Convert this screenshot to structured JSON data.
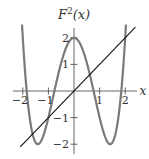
{
  "chart_data": {
    "type": "line",
    "title_display": {
      "base": "F",
      "sup": "2",
      "rest": "(x)"
    },
    "xlabel": "x",
    "ylabel": "",
    "xlim": [
      -2.1,
      2.4
    ],
    "ylim": [
      -2.2,
      2.6
    ],
    "xticks": [
      -2,
      -1,
      1,
      2
    ],
    "xtick_labels": [
      "−2",
      "−1",
      "1",
      "2"
    ],
    "yticks": [
      2,
      1,
      -1,
      -2
    ],
    "ytick_labels": [
      "2",
      "1",
      "−1",
      "−2"
    ],
    "grid": false,
    "legend": null,
    "series": [
      {
        "name": "F^2(x) = x^4 - 4x^2 + 2",
        "color": "#7a7a7a",
        "x": [
          -2.03,
          -2.0,
          -1.8,
          -1.6,
          -1.414,
          -1.2,
          -1.0,
          -0.8,
          -0.6,
          -0.4,
          -0.2,
          0.0,
          0.2,
          0.4,
          0.6,
          0.8,
          1.0,
          1.2,
          1.414,
          1.6,
          1.8,
          2.0,
          2.03
        ],
        "values": [
          2.5,
          2.0,
          -0.46,
          -1.69,
          -2.0,
          -1.69,
          -1.0,
          -0.15,
          0.69,
          1.39,
          1.84,
          2.0,
          1.84,
          1.39,
          0.69,
          -0.15,
          -1.0,
          -1.69,
          -2.0,
          -1.69,
          -0.46,
          2.0,
          2.5
        ]
      },
      {
        "name": "y = x",
        "color": "#111111",
        "x": [
          -2.1,
          2.4
        ],
        "values": [
          -2.1,
          2.4
        ]
      }
    ]
  }
}
